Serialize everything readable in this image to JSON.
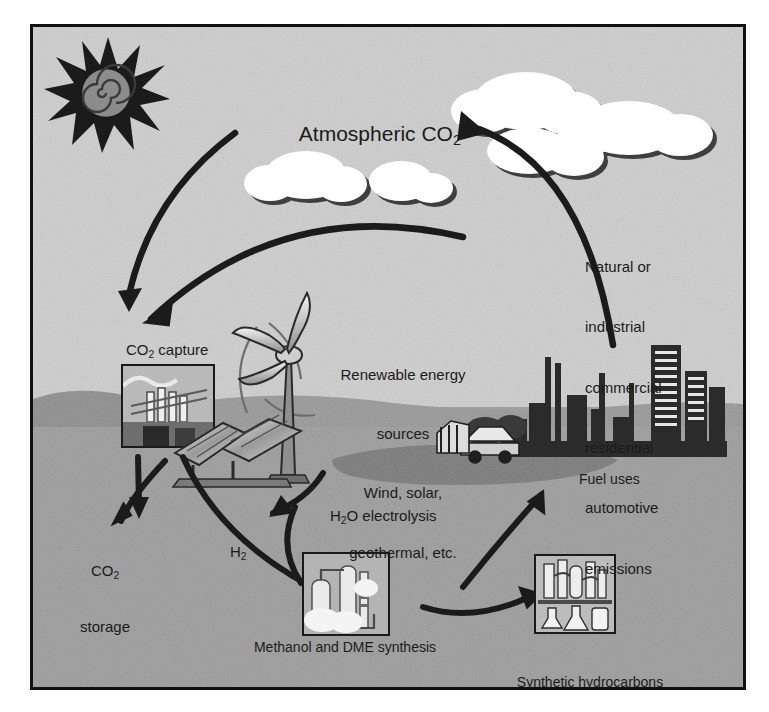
{
  "figure": {
    "frame_border_color": "#111111",
    "sky_color": "#cdcdcd",
    "ground_color": "#9d9d9d",
    "ink_color": "#1b1b1b"
  },
  "labels": {
    "atmospheric_co2": {
      "pre": "Atmospheric CO",
      "sub": "2",
      "post": ""
    },
    "co2_capture": {
      "pre": "CO",
      "sub": "2",
      "post": " capture"
    },
    "co2_storage_line1": {
      "pre": "CO",
      "sub": "2",
      "post": ""
    },
    "co2_storage_line2": "storage",
    "h2": {
      "pre": "H",
      "sub": "2",
      "post": ""
    },
    "h2o_electrolysis": {
      "pre": "H",
      "sub": "2",
      "post": "O electrolysis"
    },
    "fuel_uses": "Fuel uses",
    "renewable": [
      "Renewable energy",
      "sources",
      "Wind, solar,",
      "geothermal, etc."
    ],
    "emissions": [
      "Natural or",
      "industrial",
      "commercial",
      "residential",
      "automotive",
      "emissions"
    ],
    "methanol": "Methanol and DME synthesis",
    "synthetic": [
      "Synthetic hydrocarbons",
      "and their products as well as",
      "synthetic proteins"
    ]
  },
  "icons": {
    "sun": "sun-with-spiral-icon",
    "cloud_group_top": "cloud-cluster-icon",
    "cloud_group_mid": "cloud-cluster-icon",
    "capture_plant": "co2-capture-plant-thumbnail",
    "wind_turbine": "wind-turbine-icon",
    "solar_panel": "solar-panel-array-icon",
    "methanol_plant": "methanol-plant-thumbnail",
    "lab_glassware": "synthetic-hydrocarbons-thumbnail",
    "city_skyline": "industrial-city-skyline-icon",
    "vehicles": "vehicles-icon",
    "lake": "lake-shape"
  },
  "arrows": [
    {
      "name": "sun-to-capture",
      "from": "upper-sky-left",
      "to": "co2-capture"
    },
    {
      "name": "atmosphere-to-capture",
      "from": "atmosphere-arc",
      "to": "co2-capture"
    },
    {
      "name": "emissions-to-atmosphere",
      "from": "city",
      "to": "atmospheric-co2"
    },
    {
      "name": "capture-to-storage",
      "from": "co2-capture",
      "to": "co2-storage"
    },
    {
      "name": "capture-to-methanol",
      "from": "co2-capture",
      "to": "methanol-synthesis"
    },
    {
      "name": "electrolysis-to-h2",
      "from": "h2o-electrolysis",
      "to": "h2-branch"
    },
    {
      "name": "methanol-to-synthetic",
      "from": "methanol-synthesis",
      "to": "synthetic-hydrocarbons"
    },
    {
      "name": "synthetic-to-fuel-uses",
      "from": "synthetic-hydrocarbons",
      "to": "fuel-uses"
    }
  ]
}
